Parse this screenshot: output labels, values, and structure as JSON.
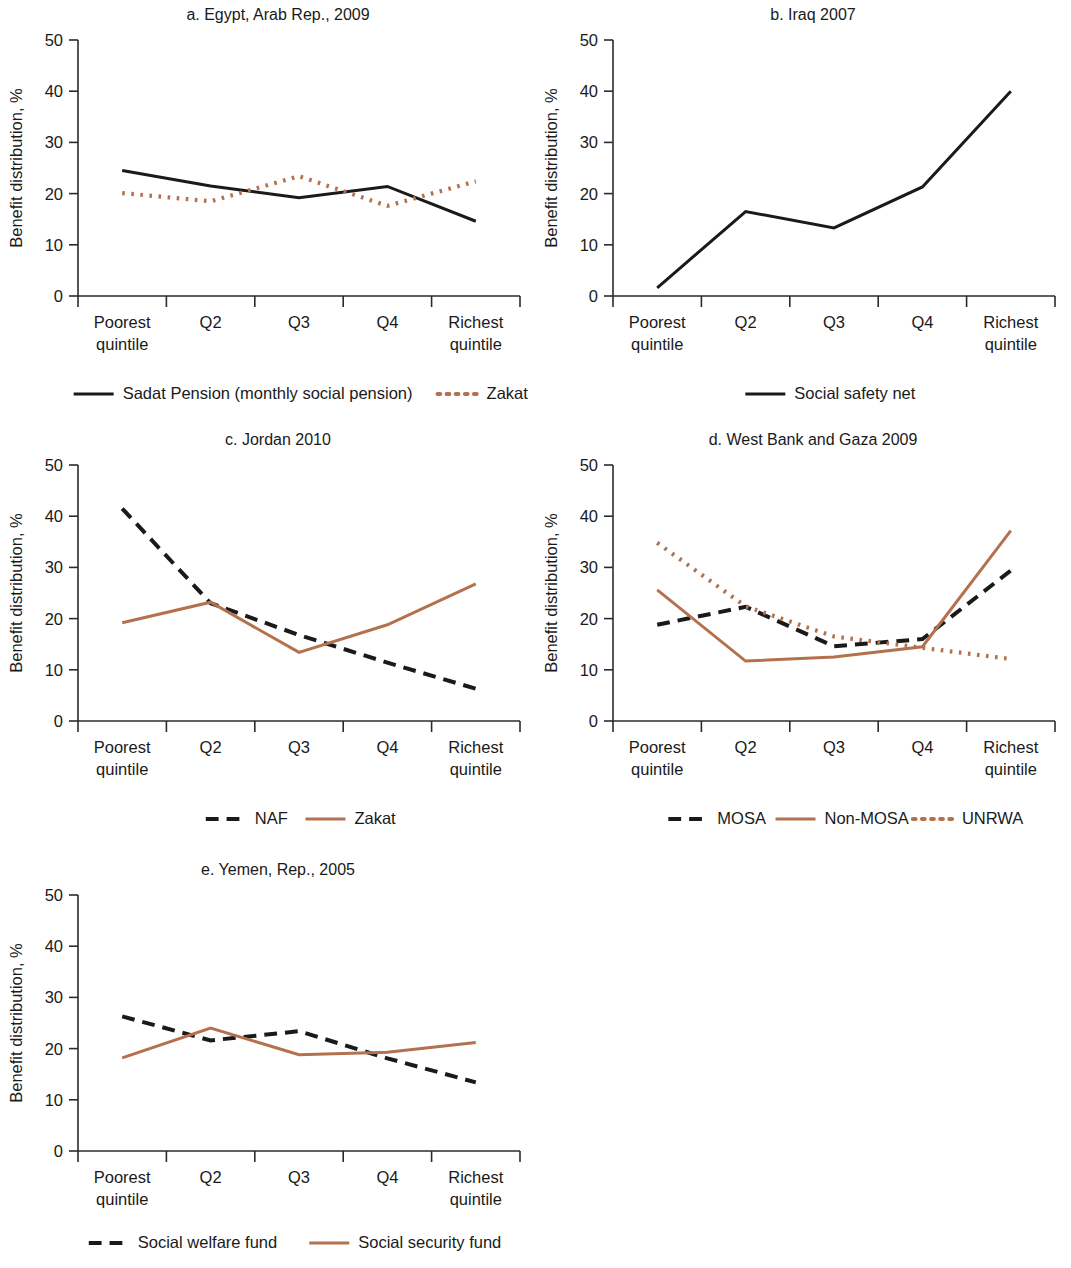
{
  "figure": {
    "colors": {
      "black": "#1a1a1a",
      "terracotta": "#b4714e",
      "axis": "#2b2b2b",
      "background": "#ffffff"
    },
    "y_axis_label": "Benefit distribution, %",
    "x_categories": [
      "Poorest quintile",
      "Q2",
      "Q3",
      "Q4",
      "Richest quintile"
    ],
    "y_ticks": [
      "0",
      "10",
      "20",
      "30",
      "40",
      "50"
    ]
  },
  "chart_data": [
    {
      "id": "a",
      "type": "line",
      "title": "a. Egypt, Arab Rep., 2009",
      "xlabel": "",
      "ylabel": "Benefit distribution, %",
      "categories": [
        "Poorest quintile",
        "Q2",
        "Q3",
        "Q4",
        "Richest quintile"
      ],
      "ylim": [
        0,
        50
      ],
      "yticks": [
        0,
        10,
        20,
        30,
        40,
        50
      ],
      "grid": false,
      "legend_position": "bottom",
      "series": [
        {
          "name": "Sadat Pension (monthly social pension)",
          "values": [
            24.5,
            21.5,
            19.2,
            21.4,
            14.6
          ],
          "color": "#1a1a1a",
          "style": "solid"
        },
        {
          "name": "Zakat",
          "values": [
            20.1,
            18.5,
            23.4,
            17.6,
            22.4
          ],
          "color": "#b4714e",
          "style": "dotted"
        }
      ]
    },
    {
      "id": "b",
      "type": "line",
      "title": "b. Iraq 2007",
      "xlabel": "",
      "ylabel": "Benefit distribution, %",
      "categories": [
        "Poorest quintile",
        "Q2",
        "Q3",
        "Q4",
        "Richest quintile"
      ],
      "ylim": [
        0,
        50
      ],
      "yticks": [
        0,
        10,
        20,
        30,
        40,
        50
      ],
      "grid": false,
      "legend_position": "bottom",
      "series": [
        {
          "name": "Social safety net",
          "values": [
            1.6,
            16.5,
            13.3,
            21.3,
            40.0
          ],
          "color": "#1a1a1a",
          "style": "solid"
        }
      ]
    },
    {
      "id": "c",
      "type": "line",
      "title": "c. Jordan 2010",
      "xlabel": "",
      "ylabel": "Benefit distribution, %",
      "categories": [
        "Poorest quintile",
        "Q2",
        "Q3",
        "Q4",
        "Richest quintile"
      ],
      "ylim": [
        0,
        50
      ],
      "yticks": [
        0,
        10,
        20,
        30,
        40,
        50
      ],
      "grid": false,
      "legend_position": "bottom",
      "series": [
        {
          "name": "NAF",
          "values": [
            41.5,
            23.0,
            16.8,
            11.4,
            6.3
          ],
          "color": "#1a1a1a",
          "style": "dashed"
        },
        {
          "name": "Zakat",
          "values": [
            19.2,
            23.2,
            13.4,
            18.8,
            26.8
          ],
          "color": "#b4714e",
          "style": "solid"
        }
      ]
    },
    {
      "id": "d",
      "type": "line",
      "title": "d. West Bank and Gaza 2009",
      "xlabel": "",
      "ylabel": "Benefit distribution, %",
      "categories": [
        "Poorest quintile",
        "Q2",
        "Q3",
        "Q4",
        "Richest quintile"
      ],
      "ylim": [
        0,
        50
      ],
      "yticks": [
        0,
        10,
        20,
        30,
        40,
        50
      ],
      "grid": false,
      "legend_position": "bottom",
      "series": [
        {
          "name": "MOSA",
          "values": [
            18.8,
            22.3,
            14.6,
            16.0,
            29.4
          ],
          "color": "#1a1a1a",
          "style": "dashed"
        },
        {
          "name": "Non-MOSA",
          "values": [
            25.6,
            11.7,
            12.5,
            14.5,
            37.2
          ],
          "color": "#b4714e",
          "style": "solid"
        },
        {
          "name": "UNRWA",
          "values": [
            34.8,
            22.4,
            16.5,
            14.3,
            12.1
          ],
          "color": "#b4714e",
          "style": "dotted"
        }
      ]
    },
    {
      "id": "e",
      "type": "line",
      "title": "e. Yemen, Rep., 2005",
      "xlabel": "",
      "ylabel": "Benefit distribution, %",
      "categories": [
        "Poorest quintile",
        "Q2",
        "Q3",
        "Q4",
        "Richest quintile"
      ],
      "ylim": [
        0,
        50
      ],
      "yticks": [
        0,
        10,
        20,
        30,
        40,
        50
      ],
      "grid": false,
      "legend_position": "bottom",
      "series": [
        {
          "name": "Social welfare fund",
          "values": [
            26.3,
            21.6,
            23.4,
            18.1,
            13.4
          ],
          "color": "#1a1a1a",
          "style": "dashed"
        },
        {
          "name": "Social security fund",
          "values": [
            18.2,
            24.0,
            18.8,
            19.3,
            21.2
          ],
          "color": "#b4714e",
          "style": "solid"
        }
      ]
    }
  ]
}
